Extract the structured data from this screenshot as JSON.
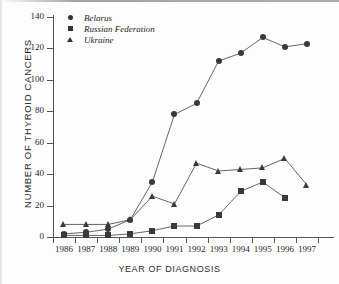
{
  "chart_data": {
    "type": "line",
    "title": "",
    "xlabel": "YEAR OF DIAGNOSIS",
    "ylabel": "NUMBER OF THYROID CANCERS",
    "x": [
      1986,
      1987,
      1988,
      1989,
      1990,
      1991,
      1992,
      1993,
      1994,
      1995,
      1996,
      1997
    ],
    "categories": [
      "1986",
      "1987",
      "1988",
      "1989",
      "1990",
      "1991",
      "1992",
      "1993",
      "1994",
      "1995",
      "1996",
      "1997"
    ],
    "xlim": [
      1985.5,
      1997.5
    ],
    "ylim": [
      0,
      140
    ],
    "yticks": [
      0,
      20,
      40,
      60,
      80,
      100,
      120,
      140
    ],
    "ytick_labels": [
      "0",
      "20",
      "40",
      "60",
      "80",
      "100",
      "120",
      "140"
    ],
    "grid": false,
    "legend_position": "top-left",
    "marker_color": "#3a3a3a",
    "line_color": "#555555",
    "series": [
      {
        "name": "Belarus",
        "marker": "circle",
        "x": [
          1986,
          1987,
          1988,
          1989,
          1990,
          1991,
          1992,
          1993,
          1994,
          1995,
          1996,
          1997
        ],
        "values": [
          2,
          3,
          5,
          11,
          35,
          78,
          85,
          112,
          117,
          127,
          121,
          123
        ]
      },
      {
        "name": "Russian Federation",
        "marker": "square",
        "x": [
          1986,
          1987,
          1988,
          1989,
          1990,
          1991,
          1992,
          1993,
          1994,
          1995,
          1996
        ],
        "values": [
          1,
          1,
          1,
          2,
          4,
          7,
          7,
          14,
          29,
          35,
          25
        ]
      },
      {
        "name": "Ukraine",
        "marker": "triangle",
        "x": [
          1986,
          1987,
          1988,
          1989,
          1990,
          1991,
          1992,
          1993,
          1994,
          1995,
          1996,
          1997
        ],
        "values": [
          8,
          8,
          8,
          11,
          26,
          21,
          47,
          42,
          43,
          44,
          50,
          33
        ]
      }
    ]
  },
  "legend": {
    "items": [
      {
        "label": "Belarus",
        "marker": "circle"
      },
      {
        "label": "Russian Federation",
        "marker": "square"
      },
      {
        "label": "Ukraine",
        "marker": "triangle"
      }
    ]
  },
  "axes": {
    "ylabel": "NUMBER OF THYROID CANCERS",
    "xlabel": "YEAR OF DIAGNOSIS"
  }
}
